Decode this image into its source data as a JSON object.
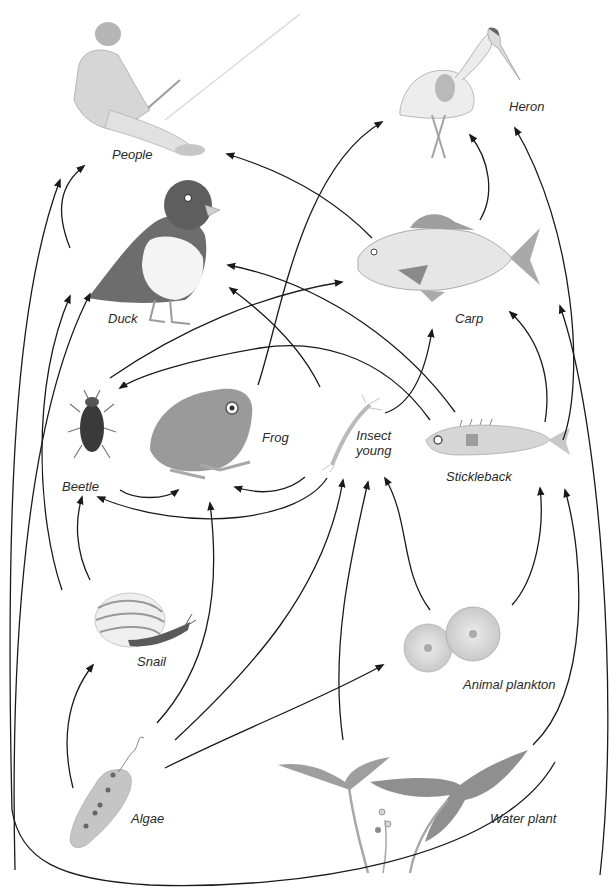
{
  "colors": {
    "arrow": "#1a1a1a",
    "label": "#2a2a2a",
    "background": "#ffffff",
    "illustration_dark": "#6e6e6e",
    "illustration_mid": "#a8a8a8",
    "illustration_light": "#d6d6d6"
  },
  "organisms": [
    {
      "id": "people",
      "label": "People",
      "icon": "fisherman-illustration",
      "x": 112,
      "y": 148
    },
    {
      "id": "heron",
      "label": "Heron",
      "icon": "heron-illustration",
      "x": 510,
      "y": 100
    },
    {
      "id": "duck",
      "label": "Duck",
      "icon": "duck-illustration",
      "x": 108,
      "y": 313
    },
    {
      "id": "carp",
      "label": "Carp",
      "icon": "carp-illustration",
      "x": 456,
      "y": 313
    },
    {
      "id": "beetle",
      "label": "Beetle",
      "icon": "beetle-illustration",
      "x": 62,
      "y": 481
    },
    {
      "id": "frog",
      "label": "Frog",
      "icon": "frog-illustration",
      "x": 262,
      "y": 432
    },
    {
      "id": "insect_young",
      "label": "Insect\nyoung",
      "icon": "insect-larva-illustration",
      "x": 356,
      "y": 437
    },
    {
      "id": "stickleback",
      "label": "Stickleback",
      "icon": "stickleback-illustration",
      "x": 446,
      "y": 471
    },
    {
      "id": "snail",
      "label": "Snail",
      "icon": "snail-illustration",
      "x": 136,
      "y": 655
    },
    {
      "id": "animal_plankton",
      "label": "Animal plankton",
      "icon": "plankton-illustration",
      "x": 463,
      "y": 679
    },
    {
      "id": "algae",
      "label": "Algae",
      "icon": "algae-illustration",
      "x": 130,
      "y": 813
    },
    {
      "id": "water_plant",
      "label": "Water plant",
      "icon": "water-plant-illustration",
      "x": 490,
      "y": 813
    }
  ],
  "labels": {
    "people": "People",
    "heron": "Heron",
    "duck": "Duck",
    "carp": "Carp",
    "beetle": "Beetle",
    "frog": "Frog",
    "insect_young_1": "Insect",
    "insect_young_2": "young",
    "stickleback": "Stickleback",
    "snail": "Snail",
    "animal_plankton": "Animal plankton",
    "algae": "Algae",
    "water_plant": "Water plant"
  },
  "edges": [
    {
      "from": "duck",
      "to": "people",
      "path": "M70 248 C55 210 60 185 84 166"
    },
    {
      "from": "carp",
      "to": "people",
      "path": "M372 238 C330 195 280 170 227 154"
    },
    {
      "from": "frog",
      "to": "heron",
      "path": "M258 385 C280 320 300 170 382 122"
    },
    {
      "from": "carp",
      "to": "heron",
      "path": "M480 220 C495 195 490 160 470 135"
    },
    {
      "from": "stickleback",
      "to": "heron",
      "path": "M563 440 C585 380 575 230 515 128"
    },
    {
      "from": "insect_young",
      "to": "duck",
      "path": "M320 387 C300 345 260 310 230 288"
    },
    {
      "from": "stickleback",
      "to": "duck",
      "path": "M455 412 C410 350 330 285 228 265"
    },
    {
      "from": "beetle",
      "to": "carp",
      "path": "M110 378 C180 330 260 295 342 282"
    },
    {
      "from": "stickleback",
      "to": "beetle",
      "path": "M430 420 C380 350 310 340 260 348 C190 360 140 375 120 388"
    },
    {
      "from": "insect_young",
      "to": "carp",
      "path": "M385 413 C410 405 425 375 432 330"
    },
    {
      "from": "stickleback",
      "to": "carp",
      "path": "M545 422 C552 380 540 340 510 312"
    },
    {
      "from": "water_plant",
      "to": "carp",
      "path": "M600 875 C620 700 600 420 560 306"
    },
    {
      "from": "snail",
      "to": "duck",
      "path": "M62 590 C38 520 30 390 70 296"
    },
    {
      "from": "algae",
      "to": "duck",
      "path": "M15 870 C10 650 25 420 90 294"
    },
    {
      "from": "snail",
      "to": "beetle",
      "path": "M90 580 C75 550 75 520 82 497"
    },
    {
      "from": "beetle",
      "to": "frog",
      "path": "M120 490 C135 500 165 500 178 490"
    },
    {
      "from": "insect_young",
      "to": "frog",
      "path": "M305 477 C290 490 265 497 235 487"
    },
    {
      "from": "insect_young",
      "to": "beetle",
      "path": "M327 478 C300 520 190 535 98 497"
    },
    {
      "from": "algae",
      "to": "snail",
      "path": "M73 788 C62 745 65 700 93 665"
    },
    {
      "from": "algae",
      "to": "frog",
      "path": "M157 723 C205 670 222 600 210 503"
    },
    {
      "from": "algae",
      "to": "insect_young",
      "path": "M175 740 C250 670 325 590 343 480"
    },
    {
      "from": "algae",
      "to": "animal_plankton",
      "path": "M165 768 C240 730 320 700 383 665"
    },
    {
      "from": "water_plant",
      "to": "insect_young",
      "path": "M343 740 C330 650 350 560 368 482"
    },
    {
      "from": "animal_plankton",
      "to": "insect_young",
      "path": "M430 610 C400 570 410 520 385 478"
    },
    {
      "from": "animal_plankton",
      "to": "stickleback",
      "path": "M512 605 C535 580 545 530 540 488"
    },
    {
      "from": "water_plant",
      "to": "stickleback",
      "path": "M533 745 C590 690 585 560 565 490"
    },
    {
      "from": "water_plant",
      "to": "people",
      "path": "M555 762 C500 860 300 890 150 885 C60 880 20 860 12 810 C5 500 15 300 60 180"
    }
  ]
}
